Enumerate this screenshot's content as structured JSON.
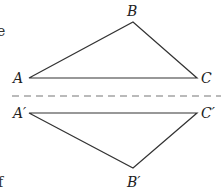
{
  "diagram": {
    "original": {
      "labels": {
        "A": "A",
        "B": "B",
        "C": "C"
      },
      "points": {
        "A": [
          29,
          78
        ],
        "B": [
          133,
          22
        ],
        "C": [
          197,
          78
        ]
      }
    },
    "reflected": {
      "labels": {
        "A": "A′",
        "B": "B′",
        "C": "C′"
      },
      "points": {
        "A": [
          29,
          113
        ],
        "B": [
          133,
          168
        ],
        "C": [
          197,
          113
        ]
      }
    },
    "mirror_line": {
      "y": 96,
      "style": "dashed",
      "color": "#777777"
    },
    "stroke_color": "#333333",
    "edge_text_fragments": [
      "e",
      "f"
    ]
  }
}
